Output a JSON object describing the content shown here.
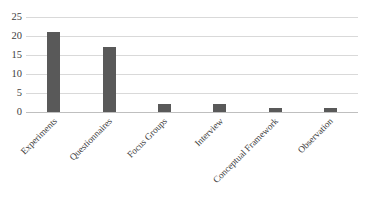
{
  "chart_data": {
    "type": "bar",
    "title": "",
    "subtitle": "",
    "xlabel": "",
    "ylabel": "",
    "categories": [
      "Experiments",
      "Questionnaires",
      "Focus Groups",
      "Interview",
      "Conceptual Framework",
      "Observation"
    ],
    "values": [
      21,
      17,
      2,
      2,
      1,
      1
    ],
    "ylim": [
      0,
      25
    ],
    "yticks": [
      0,
      5,
      10,
      15,
      20,
      25
    ],
    "ytick_labels": [
      "0",
      "5",
      "10",
      "15",
      "20",
      "25"
    ],
    "grid": true,
    "grid_axis": "y",
    "legend": false,
    "legend_position": "none",
    "bar_color": "#595959",
    "gridline_color": "#d9d9d9",
    "axis_line_color": "#bfbfbf",
    "background_color": "#ffffff",
    "text_color": "#404040",
    "label_rotation_degrees": -45
  }
}
